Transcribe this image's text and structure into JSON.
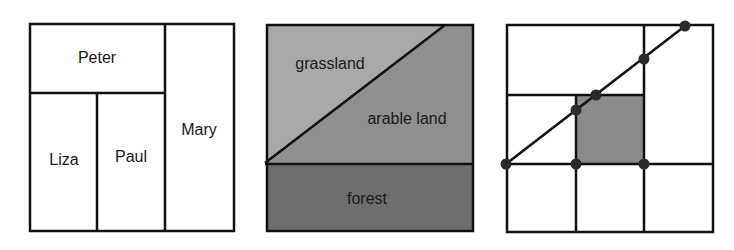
{
  "panels": [
    {
      "id": "partition",
      "labels": {
        "peter": "Peter",
        "liza": "Liza",
        "paul": "Paul",
        "mary": "Mary"
      }
    },
    {
      "id": "land-use",
      "labels": {
        "grassland": "grassland",
        "arable": "arable land",
        "forest": "forest"
      },
      "colors": {
        "grassland": "#a9a9a9",
        "arable": "#8f8f8f",
        "forest": "#6e6e6e"
      }
    },
    {
      "id": "grid-line",
      "colors": {
        "highlight": "#8a8a8a",
        "points": "#2a2a2a"
      },
      "points": [
        [
          506,
          164
        ],
        [
          576,
          164
        ],
        [
          644,
          164
        ],
        [
          576,
          110
        ],
        [
          596,
          95
        ],
        [
          644,
          59
        ],
        [
          685,
          26
        ]
      ]
    }
  ]
}
